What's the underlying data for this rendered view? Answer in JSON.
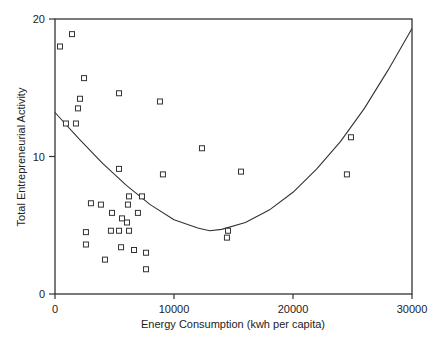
{
  "chart_data": {
    "type": "scatter",
    "title": "",
    "xlabel": "Energy Consumption (kwh per capita)",
    "ylabel": "Total Entrepreneurial Activity",
    "xlim": [
      0,
      30000
    ],
    "ylim": [
      0,
      20
    ],
    "x_ticks": [
      0,
      10000,
      20000,
      30000
    ],
    "x_tick_labels": [
      "0",
      "10000",
      "20000",
      "30000"
    ],
    "y_ticks": [
      0,
      10,
      20
    ],
    "y_tick_labels": [
      "0",
      "10",
      "20"
    ],
    "grid": false,
    "legend": null,
    "marker": "open-square",
    "points": [
      {
        "x": 420,
        "y": 18.0
      },
      {
        "x": 1430,
        "y": 18.9
      },
      {
        "x": 2440,
        "y": 15.7
      },
      {
        "x": 2100,
        "y": 14.2
      },
      {
        "x": 1930,
        "y": 13.5
      },
      {
        "x": 920,
        "y": 12.4
      },
      {
        "x": 1760,
        "y": 12.4
      },
      {
        "x": 5380,
        "y": 14.6
      },
      {
        "x": 8820,
        "y": 14.0
      },
      {
        "x": 12350,
        "y": 10.6
      },
      {
        "x": 5380,
        "y": 9.1
      },
      {
        "x": 9070,
        "y": 8.7
      },
      {
        "x": 15630,
        "y": 8.9
      },
      {
        "x": 24530,
        "y": 8.7
      },
      {
        "x": 24870,
        "y": 11.4
      },
      {
        "x": 6220,
        "y": 7.1
      },
      {
        "x": 7310,
        "y": 7.1
      },
      {
        "x": 3020,
        "y": 6.6
      },
      {
        "x": 3860,
        "y": 6.5
      },
      {
        "x": 6130,
        "y": 6.5
      },
      {
        "x": 4790,
        "y": 5.9
      },
      {
        "x": 6970,
        "y": 5.9
      },
      {
        "x": 5630,
        "y": 5.5
      },
      {
        "x": 6050,
        "y": 5.2
      },
      {
        "x": 2600,
        "y": 4.5
      },
      {
        "x": 4700,
        "y": 4.6
      },
      {
        "x": 5380,
        "y": 4.6
      },
      {
        "x": 6220,
        "y": 4.6
      },
      {
        "x": 14540,
        "y": 4.6
      },
      {
        "x": 2600,
        "y": 3.6
      },
      {
        "x": 5550,
        "y": 3.4
      },
      {
        "x": 14450,
        "y": 4.1
      },
      {
        "x": 6640,
        "y": 3.2
      },
      {
        "x": 7650,
        "y": 3.0
      },
      {
        "x": 4200,
        "y": 2.5
      },
      {
        "x": 7650,
        "y": 1.8
      }
    ],
    "fit_curve": {
      "type": "quadratic",
      "description": "U-shaped fitted curve, minimum near x=13000, y=4.6",
      "points": [
        {
          "x": 0,
          "y": 13.2
        },
        {
          "x": 2000,
          "y": 11.3
        },
        {
          "x": 4000,
          "y": 9.5
        },
        {
          "x": 6000,
          "y": 7.9
        },
        {
          "x": 8000,
          "y": 6.5
        },
        {
          "x": 10000,
          "y": 5.4
        },
        {
          "x": 12000,
          "y": 4.8
        },
        {
          "x": 13000,
          "y": 4.6
        },
        {
          "x": 14000,
          "y": 4.7
        },
        {
          "x": 16000,
          "y": 5.2
        },
        {
          "x": 18000,
          "y": 6.1
        },
        {
          "x": 20000,
          "y": 7.4
        },
        {
          "x": 22000,
          "y": 9.1
        },
        {
          "x": 24000,
          "y": 11.1
        },
        {
          "x": 26000,
          "y": 13.5
        },
        {
          "x": 28000,
          "y": 16.3
        },
        {
          "x": 30000,
          "y": 19.3
        }
      ]
    }
  }
}
